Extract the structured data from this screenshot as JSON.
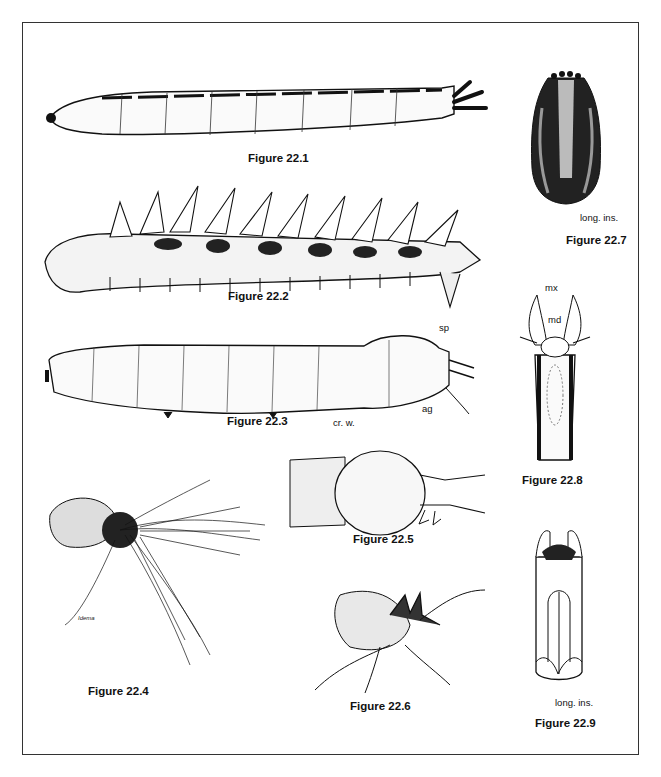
{
  "plate": {
    "figures": [
      {
        "id": "22.1",
        "caption": "Figure 22.1",
        "labels": []
      },
      {
        "id": "22.2",
        "caption": "Figure 22.2",
        "labels": []
      },
      {
        "id": "22.3",
        "caption": "Figure 22.3",
        "labels": [
          "sp",
          "cr. w.",
          "ag"
        ]
      },
      {
        "id": "22.4",
        "caption": "Figure 22.4",
        "labels": [],
        "signature": "Idema"
      },
      {
        "id": "22.5",
        "caption": "Figure 22.5",
        "labels": []
      },
      {
        "id": "22.6",
        "caption": "Figure 22.6",
        "labels": []
      },
      {
        "id": "22.7",
        "caption": "Figure 22.7",
        "labels": [
          "long. ins."
        ]
      },
      {
        "id": "22.8",
        "caption": "Figure 22.8",
        "labels": [
          "mx",
          "md"
        ]
      },
      {
        "id": "22.9",
        "caption": "Figure 22.9",
        "labels": [
          "long. ins."
        ]
      }
    ]
  },
  "colors": {
    "ink": "#111111",
    "frame": "#333333",
    "paper": "#ffffff"
  }
}
